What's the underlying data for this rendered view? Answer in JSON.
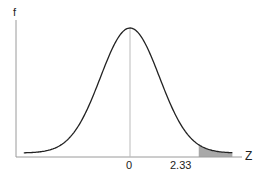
{
  "chart_data": {
    "type": "area",
    "title": "",
    "ylabel": "f",
    "xlabel": "Z",
    "x_ticks": [
      {
        "value": 0,
        "label": "0"
      },
      {
        "value": 2.33,
        "label": "2.33"
      }
    ],
    "xlim": [
      -3.5,
      3.5
    ],
    "curve": "normal pdf, mean 0, sd 1",
    "shaded_region": {
      "from": 2.33,
      "to": 3.5,
      "color": "#a9a9a9"
    },
    "center_line": {
      "x": 0
    },
    "grid": false,
    "legend": null
  },
  "labels": {
    "y_axis": "f",
    "x_axis": "Z",
    "tick_zero": "0",
    "tick_critical": "2.33"
  },
  "colors": {
    "curve": "#222222",
    "axis": "#9a9a9a",
    "shade": "#a9a9a9"
  }
}
